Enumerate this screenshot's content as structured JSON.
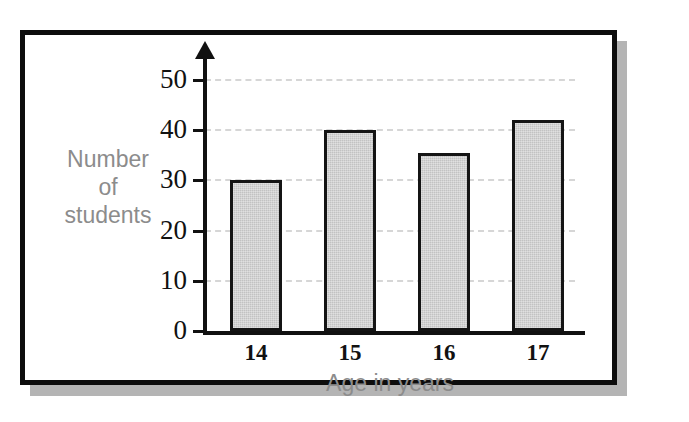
{
  "figure": {
    "frame_color": "#0d0d0d",
    "shadow_color": "#b4b4b4",
    "background_color": "#ffffff"
  },
  "chart_data": {
    "type": "bar",
    "title": "",
    "subtitle": "",
    "xlabel": "Age in years",
    "ylabel": "Number of students",
    "ylabel_lines": [
      "Number",
      "of",
      "students"
    ],
    "categories": [
      "14",
      "15",
      "16",
      "17"
    ],
    "values": [
      30,
      40,
      35.5,
      42
    ],
    "series": [
      {
        "name": "Number of students",
        "values": [
          30,
          40,
          35.5,
          42
        ]
      }
    ],
    "ylim": [
      0,
      50
    ],
    "ytick_labels": [
      "0",
      "10",
      "20",
      "30",
      "40",
      "50"
    ],
    "ytick_values": [
      0,
      10,
      20,
      30,
      40,
      50
    ],
    "grid": true,
    "grid_style": "dashed",
    "grid_color": "#d6d6d6",
    "legend": "none",
    "bar_fill_color": "#c2c2c2",
    "bar_edge_color": "#141414",
    "axis_color": "#111111",
    "axis_title_color": "#8c8c8c",
    "tick_label_color": "#111111",
    "y_axis_arrow": true,
    "annotations": []
  }
}
